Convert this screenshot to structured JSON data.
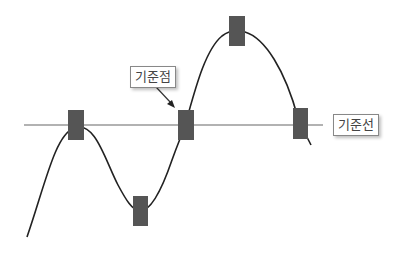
{
  "diagram": {
    "labels": {
      "reference_point": "기준점",
      "reference_line": "기준선"
    },
    "colors": {
      "marker": "#555555",
      "curve": "#222222",
      "baseline": "#999999"
    },
    "markers": [
      {
        "name": "marker-1",
        "x": 68,
        "y": 110
      },
      {
        "name": "marker-2",
        "x": 133,
        "y": 196
      },
      {
        "name": "marker-3",
        "x": 178,
        "y": 110
      },
      {
        "name": "marker-4",
        "x": 229,
        "y": 16
      },
      {
        "name": "marker-5",
        "x": 293,
        "y": 108
      }
    ]
  }
}
